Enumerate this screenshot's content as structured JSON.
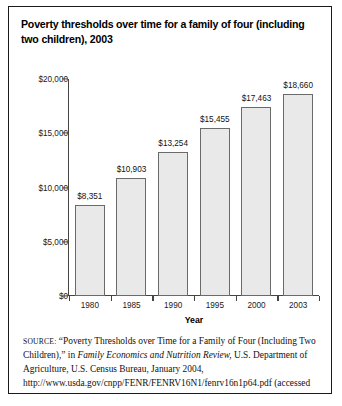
{
  "figure": {
    "title": "Poverty thresholds over time for a family of four (including two children), 2003",
    "source_label": "SOURCE:",
    "source_text_1": " “Poverty Thresholds over Time for a Family of Four (Including Two Children),” in ",
    "source_journal": "Family Economics and Nutrition Review,",
    "source_text_2": " U.S. Department of Agriculture, U.S. Census Bureau, January 2004, http://www.usda.gov/cnpp/FENR/FENRV16N1/fenrv16n1p64.pdf (accessed August 5, 2004)"
  },
  "chart_data": {
    "type": "bar",
    "title": "Poverty thresholds over time for a family of four (including two children), 2003",
    "xlabel": "Year",
    "ylabel": "",
    "categories": [
      "1980",
      "1985",
      "1990",
      "1995",
      "2000",
      "2003"
    ],
    "values": [
      8351,
      10903,
      13254,
      15455,
      17463,
      18660
    ],
    "value_labels": [
      "$8,351",
      "$10,903",
      "$13,254",
      "$15,455",
      "$17,463",
      "$18,660"
    ],
    "ylim": [
      0,
      20000
    ],
    "yticks": [
      0,
      5000,
      10000,
      15000,
      20000
    ],
    "ytick_labels": [
      "$0",
      "$5,000",
      "$10,000",
      "$15,000",
      "$20,000"
    ],
    "grid": false,
    "legend": false,
    "bar_fill_color": "#e9e9e9",
    "bar_edge_color": "#6a6a6a",
    "axis_color": "#444444"
  }
}
